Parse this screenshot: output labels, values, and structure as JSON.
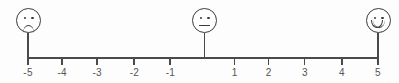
{
  "widget": {
    "name": "satisfaction-rating-scale",
    "background_color": "#fdfdfd",
    "line_color": "#4a4a4a",
    "face_color": "#3a3a3a",
    "label_color": "#555555"
  },
  "faces": [
    {
      "id": "sad",
      "icon": "sad-face-icon",
      "value": -5,
      "mouth": "frown"
    },
    {
      "id": "neutral",
      "icon": "neutral-face-icon",
      "value": 0,
      "mouth": "straight"
    },
    {
      "id": "happy",
      "icon": "happy-face-icon",
      "value": 5,
      "mouth": "smile"
    }
  ],
  "chart_data": {
    "type": "scatter",
    "title": "",
    "xlabel": "",
    "ylabel": "",
    "xlim": [
      -5,
      5
    ],
    "grid": false,
    "legend": null,
    "x": [
      -5,
      -4,
      -3,
      -2,
      -1,
      0,
      1,
      2,
      3,
      4,
      5
    ],
    "tick_labels": [
      "-5",
      "-4",
      "-3",
      "-2",
      "-1",
      "",
      "1",
      "2",
      "3",
      "4",
      "5"
    ],
    "annotations": [
      {
        "x": -5,
        "text": "sad-face-icon"
      },
      {
        "x": 0,
        "text": "neutral-face-icon"
      },
      {
        "x": 5,
        "text": "happy-face-icon"
      }
    ]
  },
  "ticks": [
    {
      "label": "-5",
      "value": -5,
      "x": 27,
      "style": "end"
    },
    {
      "label": "-4",
      "value": -4,
      "x": 61.1,
      "style": "down"
    },
    {
      "label": "-3",
      "value": -3,
      "x": 96.2,
      "style": "down"
    },
    {
      "label": "-2",
      "value": -2,
      "x": 133.3,
      "style": "down"
    },
    {
      "label": "-1",
      "value": -1,
      "x": 169.4,
      "style": "down"
    },
    {
      "label": "",
      "value": 0,
      "x": 203.5,
      "style": "center"
    },
    {
      "label": "1",
      "value": 1,
      "x": 233.6,
      "style": "down"
    },
    {
      "label": "2",
      "value": 2,
      "x": 267.7,
      "style": "down"
    },
    {
      "label": "3",
      "value": 3,
      "x": 303.8,
      "style": "down"
    },
    {
      "label": "4",
      "value": 4,
      "x": 340.9,
      "style": "down"
    },
    {
      "label": "5",
      "value": 5,
      "x": 377,
      "style": "end"
    }
  ]
}
